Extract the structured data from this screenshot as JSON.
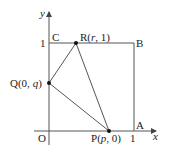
{
  "diagram": {
    "axes": {
      "x_label": "x",
      "y_label": "y",
      "origin_label": "O",
      "tick_x": "1",
      "tick_y": "1"
    },
    "square_vertices": {
      "A": "A",
      "B": "B",
      "C": "C"
    },
    "points": {
      "P": {
        "name": "P",
        "coords": "(p,  0)",
        "open": "(",
        "var": "p",
        "rest": ",  0)"
      },
      "Q": {
        "name": "Q",
        "open": "(0,  ",
        "var": "q",
        "close": ")"
      },
      "R": {
        "name": "R",
        "open": "(",
        "var": "r",
        "rest": ",  1)"
      }
    },
    "colors": {
      "line": "#555555",
      "point": "#111111",
      "text": "#222222"
    }
  }
}
